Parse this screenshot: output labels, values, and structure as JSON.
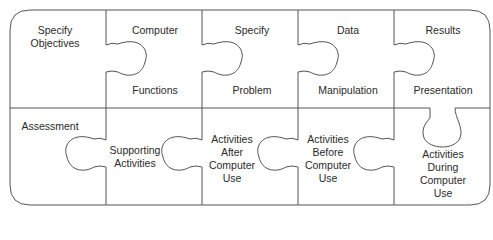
{
  "diagram": {
    "type": "jigsaw-puzzle",
    "colors": {
      "stroke": "#555555",
      "background": "#ffffff",
      "text": "#2a2a2a"
    },
    "pieces": [
      {
        "id": "specify-objectives",
        "lines": [
          "Specify",
          "Objectives"
        ]
      },
      {
        "id": "computer-functions",
        "top": "Computer",
        "bottom": "Functions"
      },
      {
        "id": "specify-problem",
        "top": "Specify",
        "bottom": "Problem"
      },
      {
        "id": "data-manipulation",
        "top": "Data",
        "bottom": "Manipulation"
      },
      {
        "id": "results-presentation",
        "top": "Results",
        "bottom": "Presentation"
      },
      {
        "id": "assessment",
        "lines": [
          "Assessment"
        ]
      },
      {
        "id": "supporting-activities",
        "lines": [
          "Supporting",
          "Activities"
        ]
      },
      {
        "id": "activities-after",
        "lines": [
          "Activities",
          "After",
          "Computer",
          "Use"
        ]
      },
      {
        "id": "activities-before",
        "lines": [
          "Activities",
          "Before",
          "Computer",
          "Use"
        ]
      },
      {
        "id": "activities-during",
        "lines": [
          "Activities",
          "During",
          "Computer",
          "Use"
        ]
      }
    ]
  }
}
